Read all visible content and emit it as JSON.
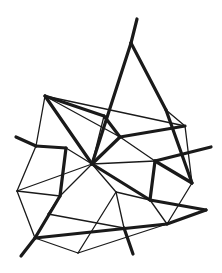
{
  "figure": {
    "kind": "line-drawing",
    "background_color": "#ffffff",
    "stroke_color": "#1a1a1a",
    "canvas": {
      "width": 222,
      "height": 273
    },
    "stroke_widths": {
      "thin": 1.3,
      "thick": 3.2
    },
    "vertices": {
      "spike_top_tip": [
        137,
        19
      ],
      "apex": [
        131,
        43
      ],
      "v_topleft": [
        45,
        96
      ],
      "v_top_mid": [
        104,
        116
      ],
      "v_upper_right": [
        185,
        126
      ],
      "v_right_upper": [
        166,
        110
      ],
      "spike_left_tip": [
        16,
        137
      ],
      "v_left_upper": [
        36,
        146
      ],
      "v_mid_left": [
        66,
        148
      ],
      "v_center": [
        92,
        164
      ],
      "v_center_upper": [
        120,
        137
      ],
      "v_right_mid": [
        155,
        161
      ],
      "spike_right_tip": [
        211,
        147
      ],
      "v_left": [
        17,
        191
      ],
      "v_far_right": [
        192,
        183
      ],
      "v_mid_lower_left": [
        60,
        196
      ],
      "v_lower_center": [
        116,
        192
      ],
      "v_lower_right": [
        150,
        200
      ],
      "v_low_left": [
        35,
        238
      ],
      "spike_lowleft_tip": [
        21,
        256
      ],
      "v_bottom": [
        78,
        253
      ],
      "v_bottom_right": [
        167,
        224
      ],
      "spike_right_low_tip": [
        206,
        210
      ],
      "v_bot_mid": [
        124,
        228
      ],
      "spike_bottom_tip": [
        133,
        254
      ],
      "v_lower_left_node": [
        48,
        214
      ],
      "v_left_low": [
        30,
        214
      ]
    },
    "edges_thin": [
      [
        [
          45,
          96
        ],
        [
          185,
          126
        ]
      ],
      [
        [
          45,
          96
        ],
        [
          104,
          116
        ]
      ],
      [
        [
          45,
          96
        ],
        [
          120,
          137
        ]
      ],
      [
        [
          45,
          96
        ],
        [
          36,
          146
        ]
      ],
      [
        [
          36,
          146
        ],
        [
          17,
          191
        ]
      ],
      [
        [
          17,
          191
        ],
        [
          60,
          196
        ]
      ],
      [
        [
          17,
          191
        ],
        [
          35,
          238
        ]
      ],
      [
        [
          185,
          126
        ],
        [
          192,
          183
        ]
      ],
      [
        [
          166,
          110
        ],
        [
          185,
          126
        ]
      ],
      [
        [
          104,
          116
        ],
        [
          92,
          164
        ]
      ],
      [
        [
          92,
          164
        ],
        [
          155,
          161
        ]
      ],
      [
        [
          92,
          164
        ],
        [
          66,
          148
        ]
      ],
      [
        [
          92,
          164
        ],
        [
          60,
          196
        ]
      ],
      [
        [
          92,
          164
        ],
        [
          116,
          192
        ]
      ],
      [
        [
          66,
          148
        ],
        [
          36,
          146
        ]
      ],
      [
        [
          155,
          161
        ],
        [
          192,
          183
        ]
      ],
      [
        [
          116,
          192
        ],
        [
          150,
          200
        ]
      ],
      [
        [
          116,
          192
        ],
        [
          78,
          253
        ]
      ],
      [
        [
          60,
          196
        ],
        [
          48,
          214
        ]
      ],
      [
        [
          35,
          238
        ],
        [
          78,
          253
        ]
      ],
      [
        [
          78,
          253
        ],
        [
          167,
          224
        ]
      ],
      [
        [
          150,
          200
        ],
        [
          167,
          224
        ]
      ],
      [
        [
          167,
          224
        ],
        [
          192,
          183
        ]
      ],
      [
        [
          116,
          192
        ],
        [
          124,
          228
        ]
      ],
      [
        [
          48,
          214
        ],
        [
          124,
          228
        ]
      ],
      [
        [
          120,
          137
        ],
        [
          155,
          161
        ]
      ],
      [
        [
          17,
          191
        ],
        [
          92,
          164
        ]
      ]
    ],
    "edges_thick": [
      [
        [
          137,
          19
        ],
        [
          131,
          43
        ]
      ],
      [
        [
          131,
          43
        ],
        [
          92,
          164
        ]
      ],
      [
        [
          131,
          43
        ],
        [
          166,
          110
        ]
      ],
      [
        [
          166,
          110
        ],
        [
          192,
          183
        ]
      ],
      [
        [
          16,
          137
        ],
        [
          36,
          146
        ]
      ],
      [
        [
          36,
          146
        ],
        [
          66,
          148
        ]
      ],
      [
        [
          66,
          148
        ],
        [
          60,
          196
        ]
      ],
      [
        [
          60,
          196
        ],
        [
          35,
          238
        ]
      ],
      [
        [
          35,
          238
        ],
        [
          21,
          256
        ]
      ],
      [
        [
          104,
          116
        ],
        [
          120,
          137
        ]
      ],
      [
        [
          120,
          137
        ],
        [
          185,
          126
        ]
      ],
      [
        [
          155,
          161
        ],
        [
          211,
          147
        ]
      ],
      [
        [
          92,
          164
        ],
        [
          150,
          200
        ]
      ],
      [
        [
          150,
          200
        ],
        [
          155,
          161
        ]
      ],
      [
        [
          92,
          164
        ],
        [
          120,
          137
        ]
      ],
      [
        [
          150,
          200
        ],
        [
          206,
          210
        ]
      ],
      [
        [
          167,
          224
        ],
        [
          206,
          210
        ]
      ],
      [
        [
          35,
          238
        ],
        [
          167,
          224
        ]
      ],
      [
        [
          124,
          228
        ],
        [
          133,
          254
        ]
      ],
      [
        [
          45,
          96
        ],
        [
          92,
          164
        ]
      ],
      [
        [
          104,
          116
        ],
        [
          45,
          96
        ]
      ],
      [
        [
          192,
          183
        ],
        [
          155,
          161
        ]
      ]
    ]
  }
}
